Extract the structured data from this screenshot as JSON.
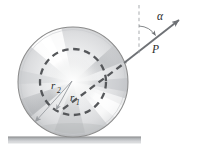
{
  "figure": {
    "type": "engineering-mechanics-diagram",
    "background_color": "#ffffff",
    "labels": {
      "force": "P",
      "angle": "α",
      "outer_radius": "r",
      "outer_radius_subscript": "2",
      "inner_radius": "r",
      "inner_radius_subscript": "1"
    },
    "colors": {
      "outline": "#8c8c8c",
      "dashed_circle": "#55575a",
      "force_arrow": "#6e7175",
      "dimension_arrow": "#9a9da1",
      "ground": "#b9bcbf",
      "ground_dark": "#8e9194",
      "label_text": "#2a2a2a",
      "wheel_light": "#ffffff",
      "wheel_mid": "#dddedf",
      "wheel_dark": "#a8abae"
    },
    "geometry": {
      "wheel_center_x": 73,
      "wheel_center_y": 82,
      "outer_radius_px": 55,
      "inner_radius_px": 33,
      "ground_y": 138,
      "ground_left_x": 8,
      "ground_right_x": 141,
      "force_arrow_tip_x": 183,
      "force_arrow_tip_y": 16,
      "vertical_reference_x": 139,
      "vertical_reference_top_y": 5,
      "vertical_reference_bottom_y": 56,
      "angle_alpha_degrees": 38
    }
  }
}
